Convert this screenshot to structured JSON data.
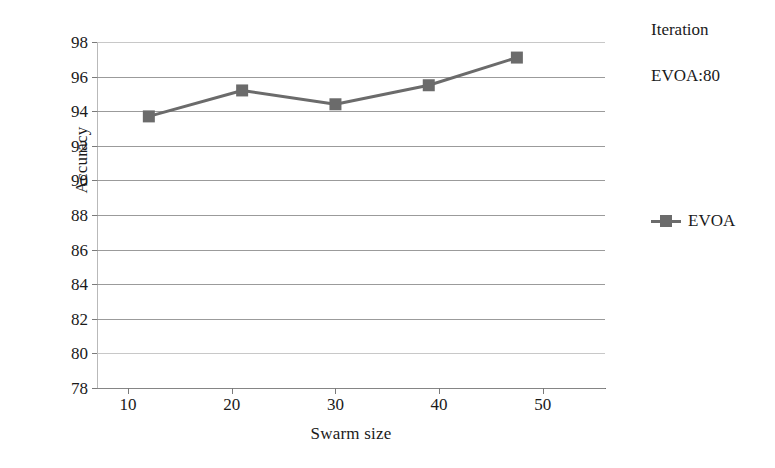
{
  "chart_data": {
    "type": "line",
    "title": "",
    "xlabel": "Swarm size",
    "ylabel": "Accuracy",
    "xlim": [
      7,
      56
    ],
    "ylim": [
      78,
      98
    ],
    "xticks": [
      10,
      20,
      30,
      40,
      50
    ],
    "yticks": [
      78,
      80,
      82,
      84,
      86,
      88,
      90,
      92,
      94,
      96,
      98
    ],
    "grid": "horizontal",
    "legend_position": "right",
    "series": [
      {
        "name": "EVOA",
        "color": "#6b6b6b",
        "marker": "square",
        "x": [
          12,
          21,
          30,
          39,
          47.5
        ],
        "values": [
          93.7,
          95.2,
          94.4,
          95.5,
          97.1
        ]
      }
    ],
    "annotations": {
      "legend_heading": "Iteration",
      "legend_subheading": "EVOA:80"
    }
  },
  "legend": {
    "heading": "Iteration",
    "subheading": "EVOA:80",
    "entries": [
      {
        "label": "EVOA",
        "color": "#6b6b6b"
      }
    ]
  },
  "axes": {
    "y_title": "Accuracy",
    "x_title": "Swarm size"
  },
  "colors": {
    "series": "#6b6b6b",
    "gridline": "#8a8a8a",
    "axis": "#6f6f6f",
    "text": "#1a1a1a",
    "background": "#ffffff"
  }
}
